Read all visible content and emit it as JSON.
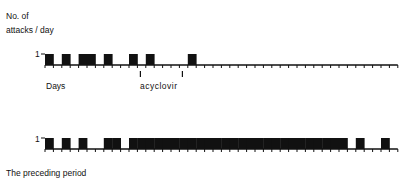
{
  "ylabel_line1": "No. of",
  "ylabel_line2": "attacks / day",
  "top_panel": {
    "ytick": "1",
    "xlabel": "Days",
    "annotation": "acyclovir"
  },
  "bottom_panel": {
    "ytick": "1",
    "caption": "The preceding period"
  },
  "chart_data": [
    {
      "type": "bar",
      "title": "Treatment period",
      "xlabel": "Days",
      "ylabel": "No. of attacks / day",
      "ylim": [
        0,
        1
      ],
      "x_range": [
        1,
        42
      ],
      "attack_days": [
        1,
        3,
        5,
        6,
        8,
        11,
        13,
        18
      ],
      "annotations": [
        {
          "text": "acyclovir",
          "start_day": 12,
          "end_day": 17
        }
      ]
    },
    {
      "type": "bar",
      "title": "The preceding period",
      "xlabel": "Days",
      "ylabel": "No. of attacks / day",
      "ylim": [
        0,
        1
      ],
      "x_range": [
        1,
        42
      ],
      "attack_days": [
        1,
        3,
        5,
        8,
        9,
        11,
        12,
        13,
        14,
        15,
        16,
        17,
        18,
        19,
        20,
        21,
        22,
        23,
        24,
        25,
        26,
        27,
        28,
        29,
        30,
        31,
        32,
        33,
        34,
        35,
        36,
        38,
        41
      ]
    }
  ]
}
